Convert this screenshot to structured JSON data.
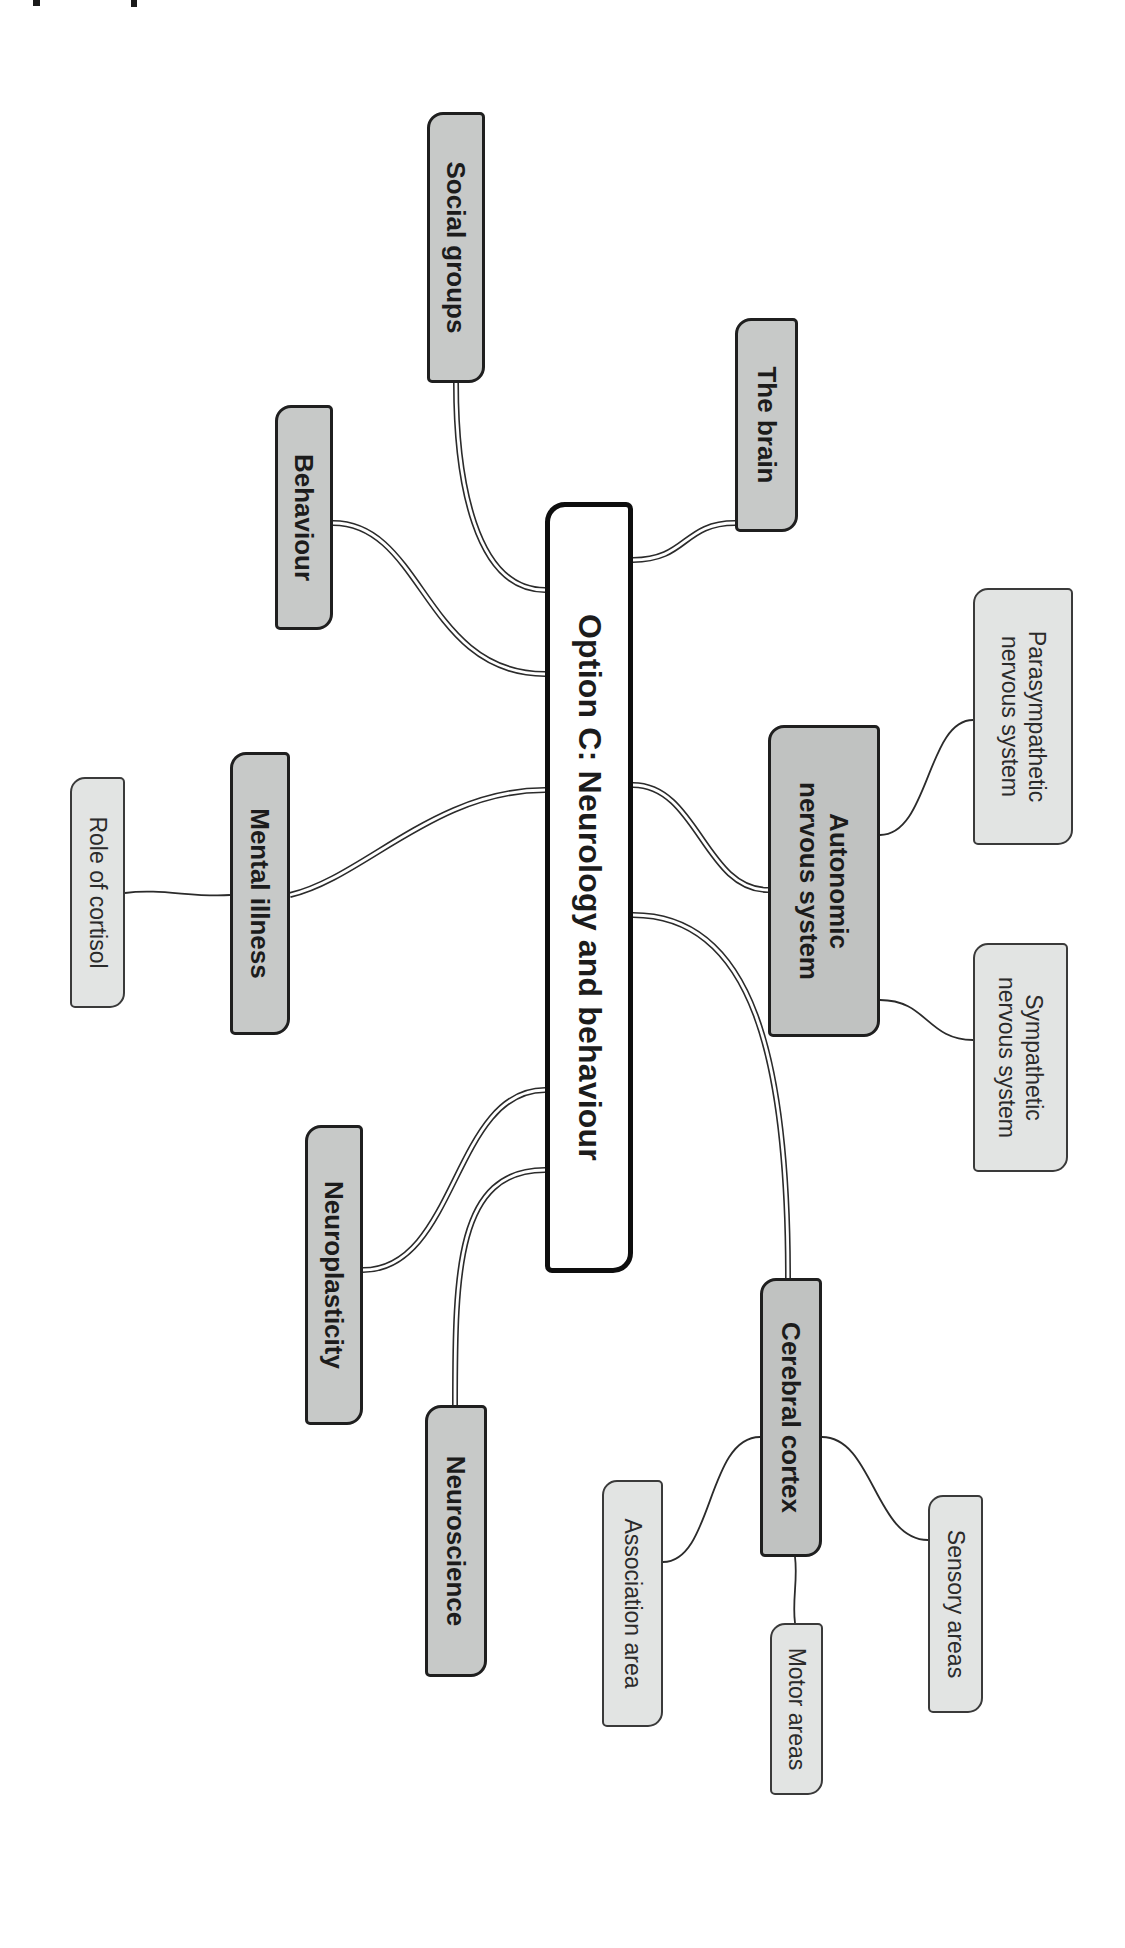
{
  "page": {
    "width": 1125,
    "height": 1948,
    "background": "#ffffff"
  },
  "palette": {
    "central_fill": "#ffffff",
    "branch_fill": "#c7c9c8",
    "branch_fill_dark": "#c0c2c1",
    "leaf_fill": "#e2e4e3",
    "line_color": "#2b2b2b",
    "line_gap_color": "#ffffff",
    "text_color": "#1c1c1c"
  },
  "artifacts": [
    {
      "x": 33,
      "y": 0,
      "w": 7,
      "h": 6
    },
    {
      "x": 131,
      "y": 0,
      "w": 6,
      "h": 7
    }
  ],
  "mindmap": {
    "nodes": [
      {
        "id": "central",
        "label": "Option C: Neurology and behaviour",
        "level": 0,
        "fill": "#ffffff",
        "box": {
          "u": 502,
          "v": 492,
          "w": 771,
          "h": 88
        }
      },
      {
        "id": "social-groups",
        "label": "Social groups",
        "level": 1,
        "fill": "#c7c9c8",
        "box": {
          "u": 112,
          "v": 640,
          "w": 271,
          "h": 58
        }
      },
      {
        "id": "the-brain",
        "label": "The brain",
        "level": 1,
        "fill": "#c7c9c8",
        "box": {
          "u": 318,
          "v": 327,
          "w": 214,
          "h": 63
        }
      },
      {
        "id": "behaviour",
        "label": "Behaviour",
        "level": 1,
        "fill": "#c7c9c8",
        "box": {
          "u": 405,
          "v": 792,
          "w": 225,
          "h": 58
        }
      },
      {
        "id": "autonomic-nervous-system",
        "label": "Autonomic\nnervous system",
        "level": 1,
        "fill": "#c0c2c1",
        "box": {
          "u": 725,
          "v": 245,
          "w": 312,
          "h": 112
        }
      },
      {
        "id": "parasympathetic-nervous-system",
        "label": "Parasympathetic\nnervous system",
        "level": 2,
        "fill": "#e2e4e3",
        "box": {
          "u": 588,
          "v": 52,
          "w": 257,
          "h": 100
        }
      },
      {
        "id": "sympathetic-nervous-system",
        "label": "Sympathetic\nnervous system",
        "level": 2,
        "fill": "#e2e4e3",
        "box": {
          "u": 943,
          "v": 57,
          "w": 229,
          "h": 95
        }
      },
      {
        "id": "mental-illness",
        "label": "Mental illness",
        "level": 1,
        "fill": "#c7c9c8",
        "box": {
          "u": 752,
          "v": 835,
          "w": 283,
          "h": 60
        }
      },
      {
        "id": "role-of-cortisol",
        "label": "Role of cortisol",
        "level": 2,
        "fill": "#e2e4e3",
        "box": {
          "u": 777,
          "v": 1000,
          "w": 231,
          "h": 55
        }
      },
      {
        "id": "neuroplasticity",
        "label": "Neuroplasticity",
        "level": 1,
        "fill": "#c7c9c8",
        "box": {
          "u": 1125,
          "v": 762,
          "w": 300,
          "h": 58
        }
      },
      {
        "id": "neuroscience",
        "label": "Neuroscience",
        "level": 1,
        "fill": "#c7c9c8",
        "box": {
          "u": 1405,
          "v": 638,
          "w": 272,
          "h": 62
        }
      },
      {
        "id": "cerebral-cortex",
        "label": "Cerebral cortex",
        "level": 1,
        "fill": "#c0c2c1",
        "box": {
          "u": 1278,
          "v": 303,
          "w": 279,
          "h": 62
        }
      },
      {
        "id": "association-area",
        "label": "Association area",
        "level": 2,
        "fill": "#e2e4e3",
        "box": {
          "u": 1480,
          "v": 462,
          "w": 247,
          "h": 61
        }
      },
      {
        "id": "motor-areas",
        "label": "Motor areas",
        "level": 2,
        "fill": "#e2e4e3",
        "box": {
          "u": 1623,
          "v": 302,
          "w": 172,
          "h": 53
        }
      },
      {
        "id": "sensory-areas",
        "label": "Sensory areas",
        "level": 2,
        "fill": "#e2e4e3",
        "box": {
          "u": 1495,
          "v": 142,
          "w": 218,
          "h": 55
        }
      }
    ],
    "connectors": [
      {
        "from": "central",
        "to": "social-groups",
        "style": "double",
        "path": "M 590 580 C 590 650 480 669 383 669"
      },
      {
        "from": "central",
        "to": "the-brain",
        "style": "double",
        "path": "M 560 492 C 560 438 523 442 523 390"
      },
      {
        "from": "central",
        "to": "behaviour",
        "style": "double",
        "path": "M 674 580 C 674 700 523 702 523 792"
      },
      {
        "from": "central",
        "to": "autonomic-nervous-system",
        "style": "double",
        "path": "M 785 492 C 785 428 890 420 890 357"
      },
      {
        "from": "central",
        "to": "mental-illness",
        "style": "double",
        "path": "M 790 580 C 790 690 878 762 895 835"
      },
      {
        "from": "central",
        "to": "cerebral-cortex",
        "style": "double",
        "path": "M 915 492 C 915 372 1060 337 1278 337"
      },
      {
        "from": "central",
        "to": "neuroplasticity",
        "style": "double",
        "path": "M 1090 580 C 1090 672 1270 668 1270 762"
      },
      {
        "from": "central",
        "to": "neuroscience",
        "style": "double",
        "path": "M 1170 580 C 1170 668 1270 670 1405 670"
      },
      {
        "from": "autonomic-nervous-system",
        "to": "parasympathetic-nervous-system",
        "style": "single",
        "path": "M 835 245 C 835 196 720 198 720 152"
      },
      {
        "from": "autonomic-nervous-system",
        "to": "sympathetic-nervous-system",
        "style": "single",
        "path": "M 1000 245 C 1000 198 1040 198 1040 152"
      },
      {
        "from": "mental-illness",
        "to": "role-of-cortisol",
        "style": "single",
        "path": "M 895 895 C 898 930 888 965 893 1000"
      },
      {
        "from": "cerebral-cortex",
        "to": "association-area",
        "style": "single",
        "path": "M 1437 365 C 1437 418 1562 412 1562 462"
      },
      {
        "from": "cerebral-cortex",
        "to": "sensory-areas",
        "style": "single",
        "path": "M 1437 303 C 1437 252 1540 250 1540 197"
      },
      {
        "from": "cerebral-cortex",
        "to": "motor-areas",
        "style": "single",
        "path": "M 1557 330 C 1580 327 1600 333 1623 330"
      }
    ]
  }
}
